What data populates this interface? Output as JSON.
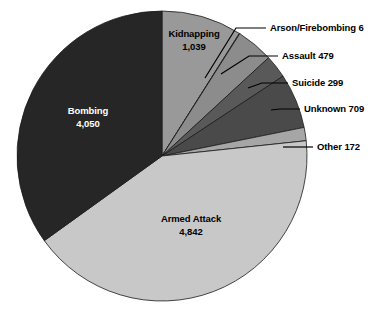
{
  "chart_data": {
    "type": "pie",
    "title": "",
    "subtitle": "",
    "xlabel": "",
    "ylabel": "",
    "legend_position": "none",
    "grid": false,
    "total": 11596,
    "start_angle_deg": 0,
    "direction": "clockwise",
    "categories": [
      "Kidnapping",
      "Arson/Firebombing",
      "Assault",
      "Suicide",
      "Unknown",
      "Other",
      "Armed Attack",
      "Bombing"
    ],
    "values": [
      1039,
      6,
      479,
      299,
      709,
      172,
      4842,
      4050
    ],
    "slices": [
      {
        "name": "Kidnapping",
        "value": 1039,
        "value_text": "1,039",
        "label_text": "Kidnapping",
        "color": "#999999",
        "label_style": "inside",
        "text_color": "dark"
      },
      {
        "name": "Arson/Firebombing",
        "value": 6,
        "value_text": "6",
        "label_text": "Arson/Firebombing 6",
        "color": "#d9d9d9",
        "label_style": "callout",
        "text_color": "dark"
      },
      {
        "name": "Assault",
        "value": 479,
        "value_text": "479",
        "label_text": "Assault 479",
        "color": "#8c8c8c",
        "label_style": "callout",
        "text_color": "dark"
      },
      {
        "name": "Suicide",
        "value": 299,
        "value_text": "299",
        "label_text": "Suicide 299",
        "color": "#595959",
        "label_style": "callout",
        "text_color": "dark"
      },
      {
        "name": "Unknown",
        "value": 709,
        "value_text": "709",
        "label_text": "Unknown 709",
        "color": "#4a4a4a",
        "label_style": "callout",
        "text_color": "dark"
      },
      {
        "name": "Other",
        "value": 172,
        "value_text": "172",
        "label_text": "Other 172",
        "color": "#a6a6a6",
        "label_style": "callout",
        "text_color": "dark"
      },
      {
        "name": "Armed Attack",
        "value": 4842,
        "value_text": "4,842",
        "label_text": "Armed Attack",
        "color": "#c8c8c8",
        "label_style": "inside",
        "text_color": "dark"
      },
      {
        "name": "Bombing",
        "value": 4050,
        "value_text": "4,050",
        "label_text": "Bombing",
        "color": "#262626",
        "label_style": "inside",
        "text_color": "light"
      }
    ]
  },
  "labels": {
    "kidnapping_name": "Kidnapping",
    "kidnapping_value": "1,039",
    "bombing_name": "Bombing",
    "bombing_value": "4,050",
    "armed_attack_name": "Armed Attack",
    "armed_attack_value": "4,842",
    "arson_callout": "Arson/Firebombing 6",
    "assault_callout": "Assault 479",
    "suicide_callout": "Suicide 299",
    "unknown_callout": "Unknown 709",
    "other_callout": "Other 172"
  },
  "colors": {
    "background": "#ffffff",
    "outline": "#1a1a1a",
    "leader": "#000000"
  }
}
